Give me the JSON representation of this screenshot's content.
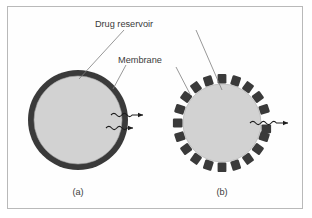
{
  "figure": {
    "title_visible": false,
    "background_color": "#ffffff",
    "frame_color": "#b9b9b9"
  },
  "labels": {
    "drug_reservoir": "Drug reservoir",
    "membrane": "Membrane",
    "panel_a": "(a)",
    "panel_b": "(b)"
  },
  "diagram_data": {
    "type": "schematic",
    "subject": "Drug delivery device cross-sections",
    "colors": {
      "membrane_dark": "#3a3a3a",
      "reservoir_fill": "#d2d2d2",
      "reservoir_outline": "#a8a8a8",
      "leader_line": "#7d7d7d",
      "arrow": "#1d1d1d",
      "text": "#3b3b3b"
    },
    "panels": [
      {
        "id": "a",
        "label": "(a)",
        "center": {
          "x": 78,
          "y": 120
        },
        "outer_radius": 50,
        "membrane_thickness": 6,
        "membrane_style": "continuous",
        "reservoir_radius": 44,
        "release_arrows": 2,
        "arrow_description": "two wavy arrows exiting to the right through the continuous membrane"
      },
      {
        "id": "b",
        "label": "(b)",
        "center": {
          "x": 222,
          "y": 123
        },
        "outer_radius": 48,
        "membrane_thickness": 9,
        "membrane_style": "segmented",
        "segment_count": 20,
        "reservoir_radius": 39,
        "release_arrows": 1,
        "arrow_description": "one wavy arrow exiting to the right through a membrane gap"
      }
    ],
    "annotations": [
      {
        "text": "Drug reservoir",
        "targets": [
          "panel-a-reservoir",
          "panel-b-reservoir"
        ],
        "leader_count": 2
      },
      {
        "text": "Membrane",
        "targets": [
          "panel-a-membrane",
          "panel-b-membrane"
        ],
        "leader_count": 2
      }
    ]
  }
}
